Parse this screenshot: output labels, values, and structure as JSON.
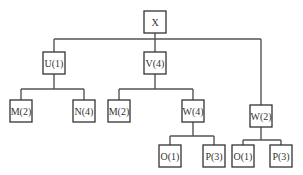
{
  "diagram": {
    "type": "tree",
    "nodes": {
      "root": {
        "label": "X",
        "x": 155,
        "y": 22
      },
      "u1": {
        "label": "U(1)",
        "x": 54,
        "y": 63
      },
      "v4": {
        "label": "V(4)",
        "x": 155,
        "y": 63
      },
      "m2a": {
        "label": "M(2)",
        "x": 21,
        "y": 111
      },
      "n4": {
        "label": "N(4)",
        "x": 84,
        "y": 111
      },
      "m2b": {
        "label": "M(2)",
        "x": 119,
        "y": 111
      },
      "w4": {
        "label": "W(4)",
        "x": 193,
        "y": 111
      },
      "w2": {
        "label": "W(2)",
        "x": 261,
        "y": 116
      },
      "o1a": {
        "label": "O(1)",
        "x": 170,
        "y": 156
      },
      "p3a": {
        "label": "P(3)",
        "x": 214,
        "y": 156
      },
      "o1b": {
        "label": "O(1)",
        "x": 243,
        "y": 156
      },
      "p3b": {
        "label": "P(3)",
        "x": 281,
        "y": 156
      }
    },
    "edges": [
      [
        "root",
        "u1"
      ],
      [
        "root",
        "v4"
      ],
      [
        "root",
        "w2"
      ],
      [
        "u1",
        "m2a"
      ],
      [
        "u1",
        "n4"
      ],
      [
        "v4",
        "m2b"
      ],
      [
        "v4",
        "w4"
      ],
      [
        "w4",
        "o1a"
      ],
      [
        "w4",
        "p3a"
      ],
      [
        "w2",
        "o1b"
      ],
      [
        "w2",
        "p3b"
      ]
    ]
  }
}
